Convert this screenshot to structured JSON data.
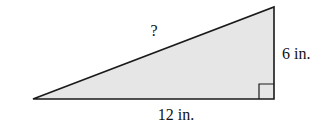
{
  "diagram": {
    "type": "right-triangle",
    "fill_color": "#e6e6e6",
    "stroke_color": "#1a1a1a",
    "labels": {
      "hypotenuse": "?",
      "vertical_leg": "6 in.",
      "horizontal_leg": "12 in."
    },
    "right_angle_marker": true
  }
}
